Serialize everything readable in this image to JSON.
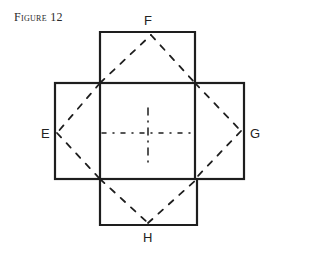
{
  "figure": {
    "caption": "Figure 12",
    "labels": {
      "top": "F",
      "left": "E",
      "right": "G",
      "bottom": "H"
    },
    "colors": {
      "line": "#1e1e1e",
      "background": "#ffffff"
    }
  }
}
